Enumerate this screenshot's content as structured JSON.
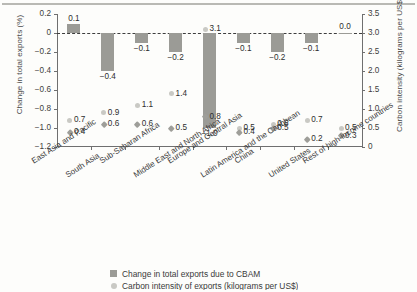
{
  "chart_data": {
    "type": "bar",
    "title": "",
    "subtitle": "",
    "categories": [
      "East Asia and Pacific",
      "South Asia",
      "Sub-Saharan Africa",
      "Middle East and North Africa",
      "Europe and Central Asia",
      "Latin America and the Caribbean",
      "China",
      "United States",
      "Rest of high-income countries"
    ],
    "xlabel": "",
    "ylabel": "Change in total exports (%)",
    "y2label": "Carbon intensity (kilograms per US$)",
    "ylim": [
      -1.2,
      0.2
    ],
    "y2lim": [
      0,
      3.5
    ],
    "yticks": [
      "0.2",
      "0",
      "-0.2",
      "-0.4",
      "-0.6",
      "-0.8",
      "-1.0",
      "-1.2"
    ],
    "ytick_values": [
      0.2,
      0,
      -0.2,
      -0.4,
      -0.6,
      -0.8,
      -1.0,
      -1.2
    ],
    "y2ticks": [
      "3.5",
      "3.0",
      "2.5",
      "2.0",
      "1.5",
      "1.0",
      "0.5",
      "0"
    ],
    "y2tick_values": [
      3.5,
      3.0,
      2.5,
      2.0,
      1.5,
      1.0,
      0.5,
      0
    ],
    "grid": false,
    "zero_reference_line": true,
    "legend_position": "bottom",
    "series": [
      {
        "name": "Change in total exports due to CBAM",
        "type": "bar",
        "axis": "left",
        "unit": "%",
        "color": "#9b9b96",
        "values": [
          0.1,
          -0.4,
          -0.1,
          -0.2,
          -1.0,
          -0.1,
          -0.2,
          -0.1,
          0.0
        ],
        "labels": [
          "0.1",
          "-0.4",
          "-0.1",
          "-0.2",
          "-1.0",
          "-0.1",
          "-0.2",
          "-0.1",
          "0.0"
        ]
      },
      {
        "name": "Carbon intensity of exports (higher)",
        "type": "scatter",
        "axis": "right",
        "marker": "circle",
        "unit": "kilograms per US$",
        "color": "#c9c9c4",
        "values": [
          0.7,
          0.9,
          1.1,
          1.4,
          3.1,
          0.5,
          0.6,
          0.7,
          0.5
        ],
        "labels": [
          "0.7",
          "0.9",
          "1.1",
          "1.4",
          "3.1",
          "0.5",
          "0.6",
          "0.7",
          "0.5"
        ]
      },
      {
        "name": "Carbon intensity of exports (lower)",
        "type": "scatter",
        "axis": "right",
        "marker": "diamond",
        "unit": "kilograms per US$",
        "color": "#9e9e99",
        "values": [
          0.4,
          0.6,
          0.6,
          0.5,
          0.8,
          0.4,
          0.5,
          0.2,
          0.3
        ],
        "labels": [
          "0.4",
          "0.6",
          "0.6",
          "0.5",
          "0.8",
          "0.4",
          "0.5",
          "0.2",
          "0.3"
        ]
      }
    ]
  },
  "axes": {
    "left_title": "Change in total exports (%)",
    "right_title": "Carbon intensity (kilograms per US$)"
  },
  "legend": {
    "items": [
      {
        "label": "Change in total exports due to CBAM",
        "marker": "bar-swatch",
        "color": "#9b9b96"
      },
      {
        "label": "Carbon intensity of exports (kilograms per US$)",
        "marker": "circle-swatch",
        "color": "#c9c9c4"
      }
    ]
  }
}
